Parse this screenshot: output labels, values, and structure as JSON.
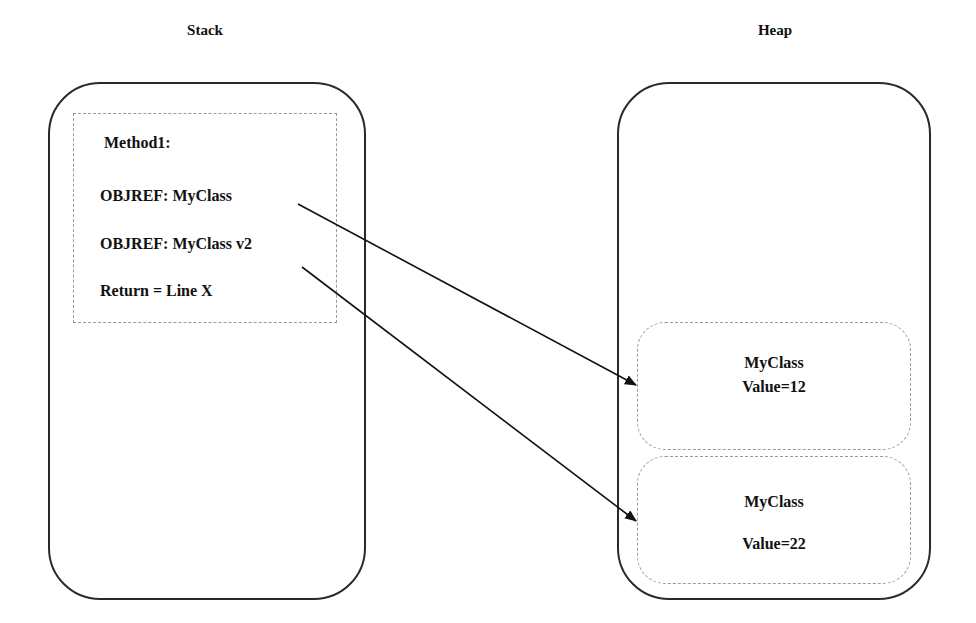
{
  "stack": {
    "title": "Stack",
    "frame": {
      "method_label": "Method1:",
      "entries": [
        "OBJREF: MyClass",
        "OBJREF: MyClass v2",
        "Return = Line X"
      ]
    }
  },
  "heap": {
    "title": "Heap",
    "objects": [
      {
        "class_name": "MyClass",
        "value": "Value=12"
      },
      {
        "class_name": "MyClass",
        "value": "Value=22"
      }
    ]
  },
  "references": [
    {
      "from": "OBJREF: MyClass",
      "to": "MyClass Value=12"
    },
    {
      "from": "OBJREF: MyClass v2",
      "to": "MyClass Value=22"
    }
  ],
  "colors": {
    "outline": "#2a2a2a",
    "dashed": "#9a9a9a",
    "arrow": "#111111"
  }
}
